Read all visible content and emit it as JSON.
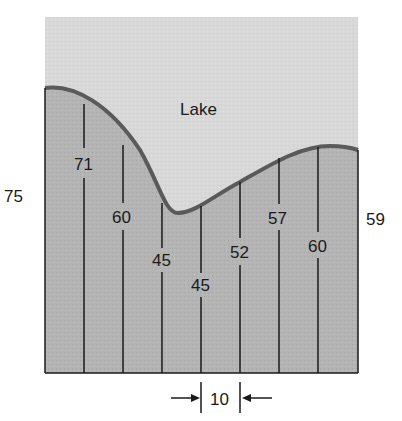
{
  "title": "Lake",
  "diagram": {
    "type": "cross-section area with vertical measurement lines",
    "region_label": "Lake",
    "spacing_label": "10",
    "edge_measurements": {
      "left": "75",
      "right": "59"
    },
    "interior_measurements": [
      "71",
      "60",
      "45",
      "45",
      "52",
      "57",
      "60"
    ],
    "colors": {
      "lake": "#d6d6d6",
      "land": "#b3b3b3",
      "outline": "#5a5a5a",
      "line": "#1a1a1a"
    }
  }
}
